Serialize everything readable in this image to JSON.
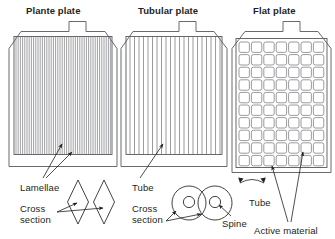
{
  "figure": {
    "background": "#ffffff",
    "line_color": "#58595b",
    "text_color": "#231f20",
    "stripe_color": "#808285"
  },
  "plates": [
    {
      "id": "plante-plate",
      "title": "Plante plate",
      "structure": "dense-vertical-lamellae",
      "stripe_count": 44,
      "labels": [
        {
          "name": "lamellae-label",
          "text": "Lamellae"
        },
        {
          "name": "cross-section-label",
          "text": "Cross\nsection"
        }
      ],
      "cross_section": {
        "type": "diamond-pair",
        "count": 2
      }
    },
    {
      "id": "tubular-plate",
      "title": "Tubular plate",
      "structure": "spaced-vertical-tubes",
      "stripe_count": 21,
      "labels": [
        {
          "name": "tube-label",
          "text": "Tube"
        },
        {
          "name": "cross-section-label",
          "text": "Cross\nsection"
        },
        {
          "name": "spine-label",
          "text": "Spine"
        }
      ],
      "cross_section": {
        "type": "concentric-circle-pair",
        "count": 2
      }
    },
    {
      "id": "flat-plate",
      "title": "Flat plate",
      "structure": "grid-of-squares",
      "grid_columns": 7,
      "grid_rows": 10,
      "labels": [
        {
          "name": "tube-label",
          "text": "Tube"
        },
        {
          "name": "active-material-label",
          "text": "Active material"
        }
      ]
    }
  ],
  "text": {
    "plante_title": "Plante plate",
    "tubular_title": "Tubular plate",
    "flat_title": "Flat plate",
    "lamellae": "Lamellae",
    "cross_line1": "Cross",
    "cross_line2": "section",
    "tube": "Tube",
    "spine": "Spine",
    "active_material": "Active material"
  }
}
